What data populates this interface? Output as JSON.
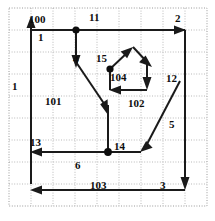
{
  "diagram": {
    "type": "directed-flow-graph-on-grid",
    "canvas": {
      "width": 215,
      "height": 221
    },
    "style": {
      "edge_color": "#1a1a1a",
      "node_color": "#0d0d0d",
      "grid_color": "#b9b9b9",
      "background": "#ffffff",
      "label_color": "#0d0d0d"
    },
    "grid": {
      "visible": true,
      "style": "dotted",
      "x_lines": [
        9,
        31,
        53,
        75,
        97,
        119,
        141,
        163,
        185,
        207
      ],
      "y_lines": [
        8,
        30,
        52,
        74,
        96,
        118,
        140,
        162,
        184,
        206
      ],
      "frame": {
        "x": 9,
        "y": 8,
        "width": 198,
        "height": 198
      }
    },
    "nodes": [
      {
        "id": "n11",
        "label": "11",
        "x": 76,
        "y": 30,
        "dot": true
      },
      {
        "id": "n104",
        "label": "104",
        "x": 110,
        "y": 69,
        "dot": true
      },
      {
        "id": "n14",
        "label": "14",
        "x": 108,
        "y": 152,
        "dot": true
      }
    ],
    "labels": [
      {
        "name": "label-100",
        "text": "100",
        "x": 29,
        "y": 14
      },
      {
        "name": "label-11",
        "text": "11",
        "x": 89,
        "y": 12
      },
      {
        "name": "label-2",
        "text": "2",
        "x": 175,
        "y": 13
      },
      {
        "name": "label-1-top",
        "text": "1",
        "x": 38,
        "y": 32
      },
      {
        "name": "label-4",
        "text": "4",
        "x": 73,
        "y": 54
      },
      {
        "name": "label-15",
        "text": "15",
        "x": 96,
        "y": 53
      },
      {
        "name": "label-104",
        "text": "104",
        "x": 110,
        "y": 72
      },
      {
        "name": "label-12",
        "text": "12",
        "x": 166,
        "y": 73
      },
      {
        "name": "label-1-left",
        "text": "1",
        "x": 12,
        "y": 81
      },
      {
        "name": "label-101",
        "text": "101",
        "x": 45,
        "y": 96
      },
      {
        "name": "label-102",
        "text": "102",
        "x": 128,
        "y": 98
      },
      {
        "name": "label-5",
        "text": "5",
        "x": 169,
        "y": 119
      },
      {
        "name": "label-13",
        "text": "13",
        "x": 30,
        "y": 137
      },
      {
        "name": "label-14",
        "text": "14",
        "x": 114,
        "y": 141
      },
      {
        "name": "label-6",
        "text": "6",
        "x": 75,
        "y": 160
      },
      {
        "name": "label-103",
        "text": "103",
        "x": 90,
        "y": 180
      },
      {
        "name": "label-3",
        "text": "3",
        "x": 160,
        "y": 180
      }
    ],
    "edges": [
      {
        "name": "edge-1-left-up",
        "from": "bottom-left",
        "to": "top-left",
        "label": "1",
        "direction": "up"
      },
      {
        "name": "edge-100-top",
        "from": "top-left",
        "to": "node-11",
        "label": "100",
        "direction": "right"
      },
      {
        "name": "edge-2-top-right",
        "from": "node-11",
        "to": "top-right",
        "label": "2",
        "direction": "right"
      },
      {
        "name": "edge-12-right-down",
        "from": "top-right",
        "to": "bottom-right",
        "label": "12",
        "direction": "down"
      },
      {
        "name": "edge-3-bottom",
        "from": "bottom-right",
        "to": "bottom-left",
        "label": "3",
        "direction": "left"
      },
      {
        "name": "edge-15-node11-down",
        "from": "node-11",
        "to": "junction-15",
        "label": "15",
        "direction": "down"
      },
      {
        "name": "edge-4-diagonal",
        "from": "junction-15",
        "to": "node-14-stem",
        "label": "4",
        "direction": "down-right"
      },
      {
        "name": "edge-stem-to-14",
        "from": "node-14-stem",
        "to": "node-14",
        "label": "",
        "direction": "down"
      },
      {
        "name": "edge-13-6-left",
        "from": "node-14",
        "to": "left-rail",
        "label": "13",
        "direction": "left"
      },
      {
        "name": "edge-6-right",
        "from": "node-14",
        "to": "corner-5",
        "label": "6",
        "direction": "right"
      },
      {
        "name": "edge-5-diagonal",
        "from": "right-rail",
        "to": "corner-5",
        "label": "5",
        "direction": "down-left"
      },
      {
        "name": "edge-104-up",
        "from": "node-104",
        "to": "apex",
        "label": "104",
        "direction": "up-right"
      },
      {
        "name": "edge-apex-down",
        "from": "apex",
        "to": "loop-right",
        "label": "",
        "direction": "down-right"
      },
      {
        "name": "edge-loop-right-down",
        "from": "loop-right",
        "to": "loop-bottom",
        "label": "",
        "direction": "down"
      },
      {
        "name": "edge-102-left",
        "from": "loop-bottom",
        "to": "node-104",
        "label": "102",
        "direction": "left"
      }
    ]
  }
}
